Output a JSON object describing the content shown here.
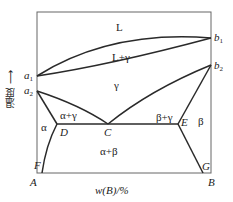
{
  "diagram": {
    "type": "binary phase diagram",
    "y_axis_label": "温度 ⟶",
    "x_axis_label": "w(B)/%",
    "corners": {
      "bottom_left": "A",
      "bottom_right": "B"
    },
    "points": {
      "a1": "a",
      "a1_sub": "1",
      "a2": "a",
      "a2_sub": "2",
      "b1": "b",
      "b1_sub": "1",
      "b2": "b",
      "b2_sub": "2",
      "C": "C",
      "D": "D",
      "E": "E",
      "F": "F",
      "G": "G"
    },
    "regions": {
      "liquid": "L",
      "liquid_gamma": "L+γ",
      "gamma": "γ",
      "alpha": "α",
      "alpha_gamma": "α+γ",
      "beta_gamma": "β+γ",
      "beta": "β",
      "alpha_beta": "α+β"
    },
    "colors": {
      "line": "#2a2a2a",
      "frame": "#555555",
      "background": "#ffffff"
    }
  }
}
